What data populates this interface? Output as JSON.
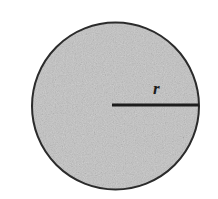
{
  "figure": {
    "name": "circle-radius-diagram",
    "background_color": "#ffffff",
    "width": 218,
    "height": 199
  },
  "chart_data": {
    "type": "diagram",
    "title": "",
    "subtitle": "",
    "xlabel": "",
    "ylabel": "",
    "shapes": [
      {
        "kind": "circle",
        "name": "shaded-circle",
        "center_x": 115.5,
        "center_y": 106,
        "radius": 84,
        "fill_color": "#c9c9c9",
        "fill_style": "speckled-gray",
        "stroke_color": "#2b2b2b",
        "stroke_width": 2
      },
      {
        "kind": "line",
        "name": "radius-segment",
        "x1": 112,
        "y1": 105,
        "x2": 199,
        "y2": 105,
        "stroke_color": "#1d1d1d",
        "stroke_width": 3
      }
    ],
    "annotations": [
      {
        "name": "radius-label",
        "text": "r",
        "x": 153,
        "y": 80,
        "style": "italic-bold-serif",
        "color": "#1d1d1d",
        "font_size": 17
      }
    ],
    "legend": [],
    "grid": false
  }
}
